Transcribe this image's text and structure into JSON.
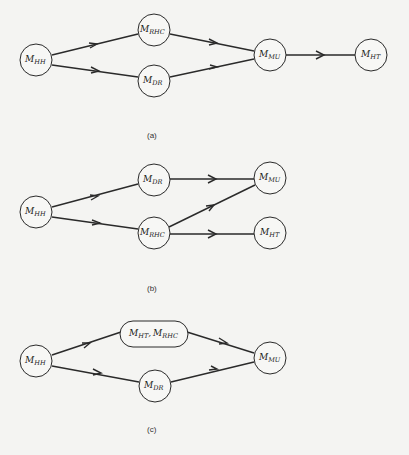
{
  "figure": {
    "subfigures": [
      {
        "caption": "(a)",
        "nodes": [
          {
            "id": "HH",
            "main": "M",
            "sub": "HH",
            "x": 36,
            "y": 60
          },
          {
            "id": "RHC",
            "main": "M",
            "sub": "RHC",
            "x": 154,
            "y": 30
          },
          {
            "id": "DR",
            "main": "M",
            "sub": "DR",
            "x": 154,
            "y": 81
          },
          {
            "id": "MU",
            "main": "M",
            "sub": "MU",
            "x": 270,
            "y": 55
          },
          {
            "id": "HT",
            "main": "M",
            "sub": "HT",
            "x": 371,
            "y": 55
          }
        ],
        "edges": [
          [
            "HH",
            "RHC"
          ],
          [
            "HH",
            "DR"
          ],
          [
            "RHC",
            "MU"
          ],
          [
            "DR",
            "MU"
          ],
          [
            "MU",
            "HT"
          ]
        ],
        "caption_pos": {
          "x": 153,
          "y": 135
        }
      },
      {
        "caption": "(b)",
        "nodes": [
          {
            "id": "HH",
            "main": "M",
            "sub": "HH",
            "x": 36,
            "y": 212
          },
          {
            "id": "DR",
            "main": "M",
            "sub": "DR",
            "x": 154,
            "y": 180
          },
          {
            "id": "RHC",
            "main": "M",
            "sub": "RHC",
            "x": 154,
            "y": 233
          },
          {
            "id": "MU",
            "main": "M",
            "sub": "MU",
            "x": 270,
            "y": 178
          },
          {
            "id": "HT",
            "main": "M",
            "sub": "HT",
            "x": 270,
            "y": 233
          }
        ],
        "edges": [
          [
            "HH",
            "DR"
          ],
          [
            "HH",
            "RHC"
          ],
          [
            "DR",
            "MU"
          ],
          [
            "RHC",
            "MU"
          ],
          [
            "RHC",
            "HT"
          ]
        ],
        "caption_pos": {
          "x": 153,
          "y": 290
        }
      },
      {
        "caption": "(c)",
        "nodes": [
          {
            "id": "HH",
            "main": "M",
            "sub": "HH",
            "x": 36,
            "y": 361
          },
          {
            "id": "HTRHC",
            "label": "M_HT, M_RHC",
            "x": 154,
            "y": 334,
            "shape": "pill"
          },
          {
            "id": "DR",
            "main": "M",
            "sub": "DR",
            "x": 155,
            "y": 386
          },
          {
            "id": "MU",
            "main": "M",
            "sub": "MU",
            "x": 270,
            "y": 358
          }
        ],
        "edges": [
          [
            "HH",
            "HTRHC"
          ],
          [
            "HH",
            "DR"
          ],
          [
            "HTRHC",
            "MU"
          ],
          [
            "DR",
            "MU"
          ]
        ],
        "caption_pos": {
          "x": 153,
          "y": 430
        }
      }
    ]
  },
  "text": {
    "a": "(a)",
    "b": "(b)",
    "c": "(c)",
    "M": "M",
    "HH": "HH",
    "RHC": "RHC",
    "DR": "DR",
    "MU": "MU",
    "HT": "HT",
    "comma": ","
  }
}
